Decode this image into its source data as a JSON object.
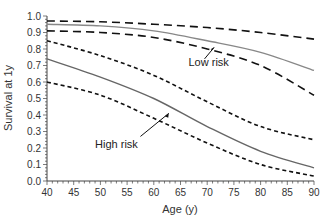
{
  "chart_data": {
    "type": "line",
    "title": "",
    "xlabel": "Age (y)",
    "ylabel": "Survival at 1y",
    "xlim": [
      40,
      90
    ],
    "ylim": [
      0.0,
      1.0
    ],
    "x_ticks": [
      "40",
      "45",
      "50",
      "55",
      "60",
      "65",
      "70",
      "75",
      "80",
      "85",
      "90"
    ],
    "y_ticks": [
      "0.0",
      "0.1",
      "0.2",
      "0.3",
      "0.4",
      "0.5",
      "0.6",
      "0.7",
      "0.8",
      "0.9",
      "1.0"
    ],
    "grid": false,
    "x": [
      40,
      50,
      60,
      70,
      80,
      90
    ],
    "series": [
      {
        "name": "Low risk",
        "style": "solid",
        "color": "#888888",
        "values": [
          0.95,
          0.94,
          0.91,
          0.85,
          0.78,
          0.67
        ]
      },
      {
        "name": "Low risk upper CI",
        "style": "dashed",
        "color": "#111111",
        "values": [
          0.97,
          0.965,
          0.95,
          0.93,
          0.9,
          0.86
        ]
      },
      {
        "name": "Low risk lower CI",
        "style": "dashed",
        "color": "#111111",
        "values": [
          0.91,
          0.9,
          0.87,
          0.8,
          0.7,
          0.52
        ]
      },
      {
        "name": "High risk",
        "style": "solid",
        "color": "#666666",
        "values": [
          0.74,
          0.63,
          0.5,
          0.33,
          0.18,
          0.08
        ]
      },
      {
        "name": "High risk upper CI",
        "style": "dotted",
        "color": "#111111",
        "values": [
          0.85,
          0.76,
          0.64,
          0.48,
          0.33,
          0.25
        ]
      },
      {
        "name": "High risk lower CI",
        "style": "dotted",
        "color": "#111111",
        "values": [
          0.6,
          0.52,
          0.38,
          0.23,
          0.1,
          0.03
        ]
      }
    ],
    "annotations": [
      {
        "text": "Low risk",
        "arrow_to": [
          70,
          0.8
        ]
      },
      {
        "text": "High risk",
        "arrow_to": [
          63,
          0.43
        ]
      }
    ],
    "legend": "none"
  }
}
